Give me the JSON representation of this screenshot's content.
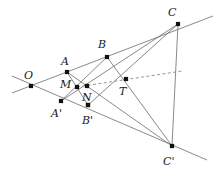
{
  "figure": {
    "kind": "geometry-diagram",
    "width": 219,
    "height": 171,
    "background_color": "#ffffff",
    "line_color": "#6b6b6b",
    "dash_color": "#8a8a8a",
    "point_color": "#111111",
    "label_color": "#1a1a1a",
    "points": [
      {
        "id": "O",
        "label": "O",
        "x": 31,
        "y": 86,
        "label_x": 24,
        "label_y": 79
      },
      {
        "id": "A",
        "label": "A",
        "x": 67,
        "y": 72,
        "label_x": 61,
        "label_y": 65
      },
      {
        "id": "M",
        "label": "M",
        "x": 77,
        "y": 87,
        "label_x": 60,
        "label_y": 88
      },
      {
        "id": "A2",
        "label": "A'",
        "x": 61,
        "y": 101,
        "label_x": 51,
        "label_y": 117
      },
      {
        "id": "B",
        "label": "B",
        "x": 107,
        "y": 57,
        "label_x": 98,
        "label_y": 48
      },
      {
        "id": "N",
        "label": "N",
        "x": 88,
        "y": 105,
        "label_x": 82,
        "label_y": 101
      },
      {
        "id": "B2",
        "label": "B'",
        "x": 88,
        "y": 105,
        "label_x": 82,
        "label_y": 124
      },
      {
        "id": "X",
        "label": "",
        "x": 87,
        "y": 86,
        "label_x": 0,
        "label_y": 0
      },
      {
        "id": "T",
        "label": "T",
        "x": 126,
        "y": 79,
        "label_x": 119,
        "label_y": 95
      },
      {
        "id": "C",
        "label": "C",
        "x": 178,
        "y": 24,
        "label_x": 168,
        "label_y": 16
      },
      {
        "id": "C2",
        "label": "C'",
        "x": 172,
        "y": 146,
        "label_x": 163,
        "label_y": 165
      }
    ],
    "segments": [
      {
        "name": "line-O-through-A-B-C",
        "x1": 12,
        "y1": 93,
        "x2": 213,
        "y2": 16,
        "dashed": false
      },
      {
        "name": "line-O-through-Ap-Bp-Cp",
        "x1": 12,
        "y1": 76,
        "x2": 207,
        "y2": 160,
        "dashed": false
      },
      {
        "name": "segment-A-Cp",
        "x1": 67,
        "y1": 72,
        "x2": 172,
        "y2": 146,
        "dashed": false
      },
      {
        "name": "segment-Ap-C",
        "x1": 61,
        "y1": 101,
        "x2": 178,
        "y2": 24,
        "dashed": false
      },
      {
        "name": "segment-B-Cp",
        "x1": 107,
        "y1": 57,
        "x2": 172,
        "y2": 146,
        "dashed": false
      },
      {
        "name": "segment-Bp-C",
        "x1": 88,
        "y1": 105,
        "x2": 178,
        "y2": 24,
        "dashed": false
      },
      {
        "name": "segment-A-Bp",
        "x1": 67,
        "y1": 72,
        "x2": 88,
        "y2": 105,
        "dashed": false
      },
      {
        "name": "segment-Ap-B",
        "x1": 61,
        "y1": 101,
        "x2": 107,
        "y2": 57,
        "dashed": false
      },
      {
        "name": "segment-C-Cp",
        "x1": 178,
        "y1": 24,
        "x2": 172,
        "y2": 146,
        "dashed": false
      },
      {
        "name": "axis-dashed-through-T",
        "x1": 77,
        "y1": 87,
        "x2": 182,
        "y2": 71,
        "dashed": true
      }
    ]
  }
}
